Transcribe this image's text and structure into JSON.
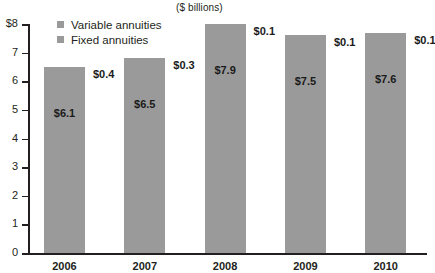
{
  "chart_data": {
    "type": "bar",
    "title": "($ billions)",
    "subtitle": "",
    "xlabel": "",
    "ylabel": "",
    "ylim": [
      0,
      8
    ],
    "grid": false,
    "stacked": true,
    "legend_position": "top-left",
    "categories": [
      "2006",
      "2007",
      "2008",
      "2009",
      "2010"
    ],
    "ytick_labels": [
      "$8",
      "7",
      "6",
      "5",
      "4",
      "3",
      "2",
      "1",
      "0"
    ],
    "ytick_values": [
      8,
      7,
      6,
      5,
      4,
      3,
      2,
      1,
      0
    ],
    "series": [
      {
        "name": "Variable annuities",
        "color": "#9a9a9a",
        "values": [
          6.1,
          6.5,
          7.9,
          7.5,
          7.6
        ],
        "labels": [
          "$6.1",
          "$6.5",
          "$7.9",
          "$7.5",
          "$7.6"
        ]
      },
      {
        "name": "Fixed annuities",
        "color": "#9a9a9a",
        "values": [
          0.4,
          0.3,
          0.1,
          0.1,
          0.1
        ],
        "labels": [
          "$0.4",
          "$0.3",
          "$0.1",
          "$0.1",
          "$0.1"
        ]
      }
    ],
    "totals": [
      6.5,
      6.8,
      8.0,
      7.6,
      7.7
    ]
  },
  "legend": {
    "items": [
      {
        "label": "Variable annuities"
      },
      {
        "label": "Fixed annuities"
      }
    ]
  }
}
